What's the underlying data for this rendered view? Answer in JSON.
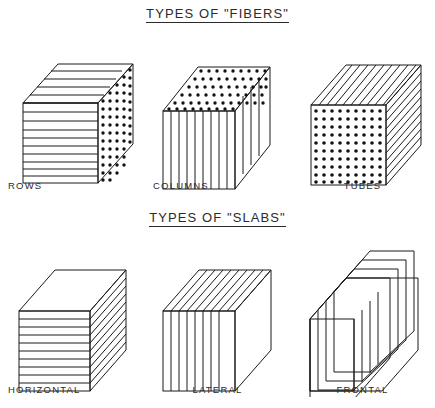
{
  "diagram": {
    "title_fibers": "TYPES OF \"FIBERS\"",
    "title_slabs": "TYPES OF \"SLABS\"",
    "ink_color": "#1a1a1a",
    "background": "#ffffff"
  },
  "sections": [
    {
      "id": "fibers",
      "title": "TYPES OF \"FIBERS\"",
      "figures": [
        {
          "id": "rows",
          "label": "ROWS",
          "front_pattern": "horizontal-lines",
          "top_pattern": "horizontal-lines",
          "side_pattern": "dots",
          "front_line_count": 11,
          "top_line_count": 5,
          "side_dot_cols": 5,
          "side_dot_rows": 12
        },
        {
          "id": "columns",
          "label": "COLUMNS",
          "front_pattern": "vertical-lines",
          "top_pattern": "dots",
          "side_pattern": "vertical-lines",
          "front_line_count": 10,
          "side_line_count": 4,
          "top_dot_cols": 9,
          "top_dot_rows": 5
        },
        {
          "id": "tubes",
          "label": "TUBES",
          "front_pattern": "dots",
          "top_pattern": "diagonal-lines",
          "side_pattern": "diagonal-lines",
          "front_dot_cols": 9,
          "front_dot_rows": 10,
          "top_line_count": 9,
          "side_line_count": 10
        }
      ]
    },
    {
      "id": "slabs",
      "title": "TYPES OF \"SLABS\"",
      "figures": [
        {
          "id": "horizontal",
          "label": "HORIZONTAL",
          "front_pattern": "horizontal-lines",
          "top_pattern": "blank",
          "side_pattern": "horizontal-slab-edges",
          "front_line_count": 10,
          "side_line_count": 10
        },
        {
          "id": "lateral",
          "label": "LATERAL",
          "front_pattern": "vertical-lines",
          "top_pattern": "vertical-slab-edges",
          "side_pattern": "blank",
          "front_line_count": 8,
          "top_line_count": 8
        },
        {
          "id": "frontal",
          "label": "FRONTAL",
          "front_pattern": "blank",
          "top_pattern": "stacked-depth-bands",
          "side_pattern": "stacked-depth-bands",
          "slab_count": 4
        }
      ]
    }
  ]
}
